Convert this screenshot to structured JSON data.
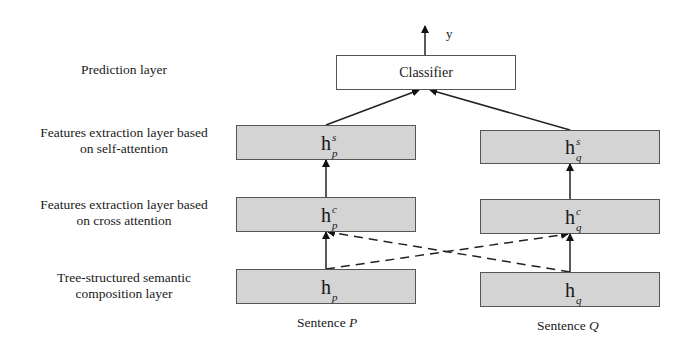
{
  "layers": {
    "prediction": "Prediction layer",
    "self_attention_line1": "Features extraction layer based",
    "self_attention_line2": "on self-attention",
    "cross_attention_line1": "Features extraction layer based",
    "cross_attention_line2": "on cross attention",
    "tree_line1": "Tree-structured semantic",
    "tree_line2": "composition layer"
  },
  "classifier": {
    "label": "Classifier",
    "output": "y"
  },
  "nodes": {
    "hp_s": {
      "base": "h",
      "sup": "s",
      "sub": "p"
    },
    "hq_s": {
      "base": "h",
      "sup": "s",
      "sub": "q"
    },
    "hp_c": {
      "base": "h",
      "sup": "c",
      "sub": "p"
    },
    "hq_c": {
      "base": "h",
      "sup": "c",
      "sub": "q"
    },
    "hp": {
      "base": "h",
      "sup": "",
      "sub": "p"
    },
    "hq": {
      "base": "h",
      "sup": "",
      "sub": "q"
    }
  },
  "sentences": {
    "p": {
      "prefix": "Sentence ",
      "var": "P"
    },
    "q": {
      "prefix": "Sentence ",
      "var": "Q"
    }
  },
  "colors": {
    "box_fill": "#d4d4d4",
    "border": "#555555",
    "line": "#222222"
  }
}
